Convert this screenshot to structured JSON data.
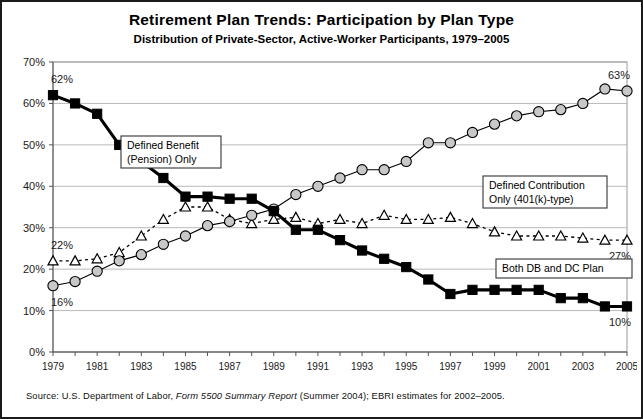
{
  "chart_data": {
    "type": "line",
    "title": "Retirement Plan Trends: Participation by Plan Type",
    "subtitle": "Distribution of Private-Sector, Active-Worker Participants, 1979–2005",
    "xlabel": "",
    "ylabel": "",
    "ylim": [
      0,
      70
    ],
    "ytick_labels": [
      "0%",
      "10%",
      "20%",
      "30%",
      "40%",
      "50%",
      "60%",
      "70%"
    ],
    "ytick_values": [
      0,
      10,
      20,
      30,
      40,
      50,
      60,
      70
    ],
    "grid": true,
    "legend_position": "inline-callouts",
    "x": [
      1979,
      1980,
      1981,
      1982,
      1983,
      1984,
      1985,
      1986,
      1987,
      1988,
      1989,
      1990,
      1991,
      1992,
      1993,
      1994,
      1995,
      1996,
      1997,
      1998,
      1999,
      2000,
      2001,
      2002,
      2003,
      2004,
      2005
    ],
    "xtick_labels": [
      "1979",
      "1981",
      "1983",
      "1985",
      "1987",
      "1989",
      "1991",
      "1993",
      "1995",
      "1997",
      "1999",
      "2001",
      "2003",
      "2005"
    ],
    "xtick_values": [
      1979,
      1981,
      1983,
      1985,
      1987,
      1989,
      1991,
      1993,
      1995,
      1997,
      1999,
      2001,
      2003,
      2005
    ],
    "series": [
      {
        "name": "Defined Benefit (Pension) Only",
        "key": "db",
        "marker": "filled-square",
        "color": "#000000",
        "values": [
          62,
          60,
          57.5,
          50,
          46,
          42,
          37.5,
          37.5,
          37,
          37,
          34,
          29.5,
          29.5,
          27,
          24.5,
          22.5,
          20.5,
          17.5,
          14,
          15,
          15,
          15,
          15,
          13,
          13,
          11,
          11
        ]
      },
      {
        "name": "Defined Contribution Only (401(k)-type)",
        "key": "dc",
        "marker": "filled-circle",
        "color": "#c8c8c8",
        "values": [
          16,
          17,
          19.5,
          22,
          23.5,
          26,
          28,
          30.5,
          31.5,
          33,
          34.5,
          38,
          40,
          42,
          44,
          44,
          46,
          50.5,
          50.5,
          53,
          55,
          57,
          58,
          58.5,
          60,
          63.5,
          63
        ]
      },
      {
        "name": "Both DB and DC Plan",
        "key": "both",
        "marker": "open-triangle",
        "color": "#ffffff",
        "values": [
          22,
          22,
          22.5,
          24,
          28,
          32,
          35,
          35,
          32,
          31,
          32,
          32.5,
          31,
          32,
          31,
          33,
          32,
          32,
          32.5,
          31,
          29,
          28,
          28,
          28,
          27.5,
          27,
          27
        ]
      }
    ],
    "annotations": [
      {
        "text": "62%",
        "series": "db",
        "x": 1979,
        "y": 62,
        "position": "above-left"
      },
      {
        "text": "16%",
        "series": "dc",
        "x": 1979,
        "y": 16,
        "position": "below-left"
      },
      {
        "text": "22%",
        "series": "both",
        "x": 1979,
        "y": 22,
        "position": "above-left"
      },
      {
        "text": "63%",
        "series": "dc",
        "x": 2005,
        "y": 63,
        "position": "above-right"
      },
      {
        "text": "27%",
        "series": "both",
        "x": 2005,
        "y": 27,
        "position": "below-right"
      },
      {
        "text": "10%",
        "series": "db",
        "x": 2005,
        "y": 11,
        "position": "below-right"
      }
    ],
    "callouts": [
      {
        "id": "callout-db",
        "lines": [
          "Defined  Benefit",
          "(Pension)  Only"
        ],
        "x": 112,
        "y": 80,
        "w": 100,
        "h": 32
      },
      {
        "id": "callout-dc",
        "lines": [
          "Defined  Contribution",
          "Only  (401(k)-type)"
        ],
        "x": 474,
        "y": 120,
        "w": 124,
        "h": 32
      },
      {
        "id": "callout-both",
        "lines": [
          "Both  DB  and  DC  Plan"
        ],
        "x": 487,
        "y": 203,
        "w": 136,
        "h": 19
      }
    ]
  },
  "source": {
    "prefix": "Source: U.S. Department of Labor, ",
    "italic1": "Form 5500 Summary Report",
    "suffix": " (Summer 2004); EBRI estimates for 2002–2005."
  },
  "colors": {
    "frame": "#1a1a1a",
    "grid": "#b9b9b9",
    "db_marker": "#000000",
    "dc_marker": "#c8c8c8",
    "both_marker": "#ffffff",
    "text": "#000000"
  }
}
